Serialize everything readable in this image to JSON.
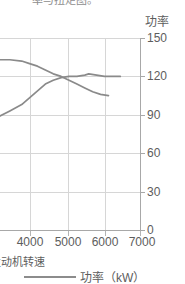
{
  "title": {
    "text": "率与扭矩图。",
    "note": "cropped-top-title"
  },
  "axis": {
    "y_caption": "功率",
    "y_ticks": [
      "150",
      "120",
      "90",
      "60",
      "30",
      "0"
    ],
    "x_ticks": [
      "4000",
      "5000",
      "6000",
      "7000"
    ],
    "x_caption_partial": "发动机转速"
  },
  "legend": {
    "left_partial": "m)",
    "power_label": "功率（kW）",
    "line_color": "#8c8c8c"
  },
  "colors": {
    "grid": "#d6d6d6",
    "axis": "#a8a8a8",
    "text": "#5d5d5d",
    "curve_power": "#8a8a8a",
    "curve_torque": "#8a8a8a",
    "background": "#ffffff"
  },
  "chart_data": {
    "type": "line",
    "title": "率与扭矩图。",
    "xlabel": "发动机转速",
    "ylabel": "功率",
    "xlim": [
      3450,
      7000
    ],
    "ylim": [
      0,
      150
    ],
    "grid": true,
    "legend_position": "bottom",
    "x_ticks": [
      4000,
      5000,
      6000,
      7000
    ],
    "y_ticks": [
      0,
      30,
      60,
      90,
      120,
      150
    ],
    "series": [
      {
        "name": "功率（kW）",
        "unit": "kW",
        "x": [
          3450,
          3700,
          4000,
          4300,
          4600,
          4800,
          5000,
          5200,
          5400,
          5600,
          5700,
          5900,
          6100,
          6300,
          6500
        ],
        "values": [
          89,
          93,
          98,
          106,
          114,
          117,
          119,
          120,
          120,
          121,
          122,
          121,
          120,
          120,
          120
        ]
      },
      {
        "name": "扭矩",
        "unit": "N·m",
        "x": [
          3450,
          3700,
          4000,
          4200,
          4400,
          4600,
          4800,
          5000,
          5200,
          5400,
          5600,
          5800,
          6000,
          6200
        ],
        "values": [
          133,
          133,
          132,
          130,
          128,
          125,
          122,
          120,
          117,
          114,
          111,
          108,
          106,
          105
        ]
      }
    ]
  }
}
